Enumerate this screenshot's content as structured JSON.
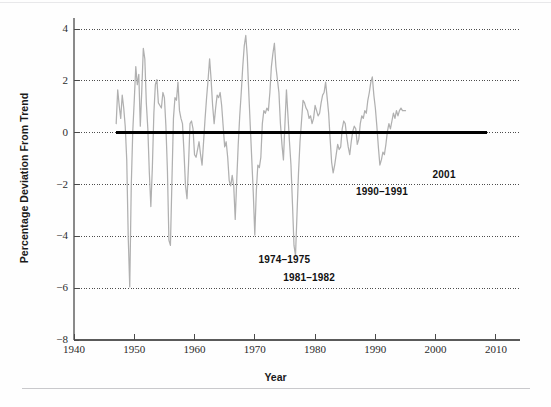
{
  "figure": {
    "background_color": "#fefefe",
    "series_color": "#b0b0b0",
    "zero_line_color": "#000000",
    "grid_color": "#4d4d4d",
    "axis_color": "#8a8a8a",
    "text_color": "#1a1a1a"
  },
  "chart_data": {
    "type": "line",
    "title": "",
    "subtitle": "",
    "xlabel": "Year",
    "ylabel": "Percentage Deviation From Trend",
    "xlim": [
      1940,
      2014
    ],
    "ylim": [
      -8,
      4.6
    ],
    "xticks": [
      1940,
      1950,
      1960,
      1970,
      1980,
      1990,
      2000,
      2010
    ],
    "xtick_labels": [
      "1940",
      "1950",
      "1960",
      "1970",
      "1980",
      "1990",
      "2000",
      "2010"
    ],
    "yticks": [
      4,
      2,
      0,
      -2,
      -4,
      -6,
      -8
    ],
    "ytick_labels": [
      "4",
      "2",
      "0",
      "−2",
      "−4",
      "−6",
      "−8"
    ],
    "grid": true,
    "grid_axis": "y",
    "grid_style": "dotted",
    "legend": null,
    "legend_position": "none",
    "reference_lines": [
      {
        "name": "trend-zero-line",
        "y": 0,
        "x_start": 1947.0,
        "x_end": 2008.5,
        "style": "solid-thick",
        "color": "#000000"
      }
    ],
    "annotations": [
      {
        "id": "recession-1974-1975",
        "text": "1974–1975",
        "x": 1970.6,
        "y": -4.9,
        "bold": true
      },
      {
        "id": "recession-1981-1982",
        "text": "1981–1982",
        "x": 1974.7,
        "y": -5.6,
        "bold": true
      },
      {
        "id": "recession-1990-1991",
        "text": "1990–1991",
        "x": 1986.8,
        "y": -2.3,
        "bold": true
      },
      {
        "id": "recession-2001",
        "text": "2001",
        "x": 1999.5,
        "y": -1.65,
        "bold": true
      }
    ],
    "series": [
      {
        "name": "Real GDP percentage deviation from trend",
        "color": "#b0b0b0",
        "x_start": 1947.0,
        "x_step": 0.25,
        "values": [
          0.35,
          1.65,
          1.05,
          0.55,
          1.45,
          0.95,
          0.25,
          -1.05,
          -4.05,
          -5.95,
          -2.05,
          0.05,
          1.25,
          2.55,
          1.85,
          2.25,
          0.25,
          1.65,
          3.25,
          2.85,
          1.15,
          0.15,
          -1.55,
          -2.85,
          -1.35,
          0.75,
          1.85,
          2.05,
          1.15,
          1.05,
          0.95,
          1.55,
          1.35,
          0.25,
          -1.45,
          -4.15,
          -4.35,
          -1.85,
          0.55,
          1.35,
          1.25,
          1.95,
          0.85,
          0.55,
          0.35,
          -0.75,
          -2.05,
          -2.55,
          -1.25,
          0.35,
          0.45,
          0.15,
          -0.85,
          -0.95,
          -0.65,
          -0.35,
          -0.85,
          -1.25,
          -0.35,
          0.55,
          1.35,
          2.05,
          2.85,
          2.05,
          1.05,
          0.35,
          0.95,
          1.45,
          1.35,
          1.55,
          1.05,
          0.25,
          -0.55,
          -0.35,
          -0.95,
          -1.85,
          -2.05,
          -1.65,
          -2.05,
          -3.35,
          -1.85,
          -0.45,
          0.65,
          1.55,
          2.55,
          3.35,
          3.75,
          2.95,
          1.55,
          0.25,
          -1.05,
          -2.35,
          -3.95,
          -2.25,
          -1.25,
          -1.35,
          -0.95,
          0.35,
          0.85,
          0.75,
          0.95,
          0.85,
          1.55,
          2.55,
          3.05,
          3.45,
          2.55,
          2.05,
          1.55,
          0.35,
          -0.45,
          -1.05,
          0.35,
          1.65,
          0.65,
          -0.35,
          -1.25,
          -2.75,
          -4.35,
          -4.75,
          -3.15,
          -1.55,
          -0.35,
          0.45,
          1.25,
          1.15,
          0.95,
          0.85,
          0.55,
          0.65,
          0.35,
          0.55,
          1.05,
          0.85,
          0.65,
          0.75,
          1.15,
          1.45,
          1.55,
          1.95,
          1.35,
          0.75,
          -0.25,
          -1.15,
          -1.55,
          -1.25,
          -0.85,
          -0.45,
          -0.65,
          -0.55,
          0.15,
          0.45,
          0.35,
          -0.15,
          -0.55,
          -0.85,
          -0.35,
          0.05,
          0.25,
          0.15,
          -0.45,
          -0.25,
          0.35,
          0.65,
          0.55,
          0.85,
          0.75,
          1.25,
          1.55,
          1.95,
          2.15,
          1.45,
          0.95,
          0.25,
          -0.55,
          -1.25,
          -1.05,
          -0.75,
          -0.85,
          -0.45,
          0.05,
          0.35,
          0.15,
          0.45,
          0.75,
          0.55,
          0.85,
          0.65,
          0.85,
          0.95,
          0.85,
          0.85,
          0.85
        ]
      }
    ]
  },
  "axis_titles": {
    "x": "Year",
    "y": "Percentage Deviation From Trend"
  }
}
